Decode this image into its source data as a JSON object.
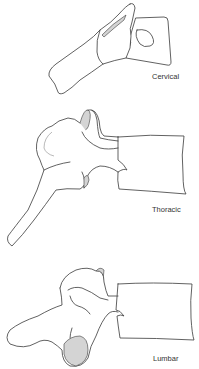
{
  "figure": {
    "colors": {
      "outline": "#3a3a3a",
      "shading": "#d4d4d4",
      "background": "#ffffff",
      "label": "#333333"
    },
    "vertebrae": [
      {
        "label": "Cervical"
      },
      {
        "label": "Thoracic"
      },
      {
        "label": "Lumbar"
      }
    ]
  }
}
